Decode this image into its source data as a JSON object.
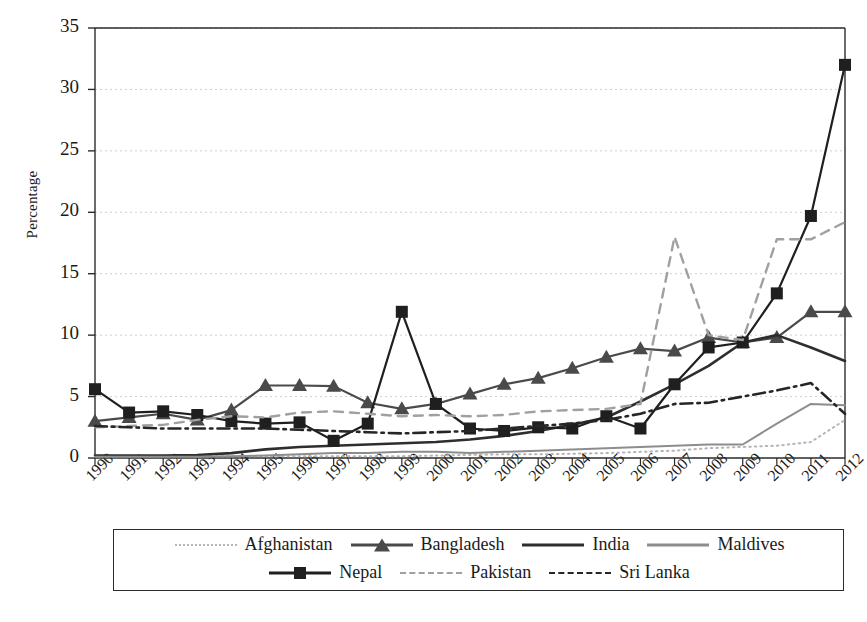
{
  "chart_data": {
    "type": "line",
    "title": "",
    "xlabel": "",
    "ylabel": "Percentage",
    "ylim": [
      0,
      35
    ],
    "yticks": [
      0,
      5,
      10,
      15,
      20,
      25,
      30,
      35
    ],
    "grid": true,
    "grid_axis": "y",
    "legend_position": "bottom",
    "x": [
      1990,
      1991,
      1992,
      1993,
      1994,
      1995,
      1996,
      1997,
      1998,
      1999,
      2000,
      2001,
      2002,
      2003,
      2004,
      2005,
      2006,
      2007,
      2008,
      2009,
      2010,
      2011,
      2012
    ],
    "categories": [
      "1990",
      "1991",
      "1992",
      "1993",
      "1994",
      "1995",
      "1996",
      "1997",
      "1998",
      "1999",
      "2000",
      "2001",
      "2002",
      "2003",
      "2004",
      "2005",
      "2006",
      "2007",
      "2008",
      "2009",
      "2010",
      "2011",
      "2012"
    ],
    "series": [
      {
        "name": "Afghanistan",
        "style": "dotted",
        "color": "#b5b5b5",
        "marker": "none",
        "values": [
          0.15,
          0.15,
          0.15,
          0.15,
          0.15,
          0.15,
          0.15,
          0.15,
          0.15,
          0.15,
          0.2,
          0.25,
          0.3,
          0.3,
          0.35,
          0.4,
          0.5,
          0.6,
          0.8,
          0.9,
          1.0,
          1.3,
          3.1
        ]
      },
      {
        "name": "Bangladesh",
        "style": "solid",
        "color": "#4a4a4a",
        "marker": "triangle",
        "values": [
          3.0,
          3.3,
          3.6,
          3.1,
          3.9,
          5.9,
          5.9,
          5.85,
          4.5,
          4.0,
          4.4,
          5.2,
          6.0,
          6.5,
          7.3,
          8.2,
          8.9,
          8.7,
          9.8,
          9.4,
          9.8,
          11.9,
          11.9
        ]
      },
      {
        "name": "India",
        "style": "solid",
        "color": "#2e2e2e",
        "marker": "none",
        "values": [
          0.2,
          0.2,
          0.2,
          0.25,
          0.4,
          0.7,
          0.9,
          1.0,
          1.1,
          1.2,
          1.3,
          1.5,
          1.8,
          2.2,
          2.7,
          3.3,
          4.6,
          6.0,
          7.5,
          9.4,
          10.0,
          9.0,
          7.9
        ]
      },
      {
        "name": "Maldives",
        "style": "solid",
        "color": "#8d8d8d",
        "marker": "none",
        "values": [
          0.1,
          0.1,
          0.1,
          0.1,
          0.15,
          0.2,
          0.3,
          0.4,
          0.4,
          0.5,
          0.5,
          0.4,
          0.5,
          0.6,
          0.7,
          0.8,
          0.9,
          1.0,
          1.1,
          1.1,
          2.8,
          4.4,
          4.3
        ]
      },
      {
        "name": "Nepal",
        "style": "solid",
        "color": "#1f1f1f",
        "marker": "square",
        "values": [
          5.6,
          3.7,
          3.8,
          3.5,
          3.0,
          2.8,
          2.9,
          1.4,
          2.8,
          11.9,
          4.4,
          2.4,
          2.2,
          2.5,
          2.4,
          3.4,
          2.4,
          6.0,
          9.0,
          9.4,
          13.4,
          19.7,
          32.0
        ]
      },
      {
        "name": "Pakistan",
        "style": "dashed",
        "color": "#a0a0a0",
        "marker": "none",
        "values": [
          2.5,
          2.6,
          2.7,
          3.1,
          3.4,
          3.3,
          3.7,
          3.8,
          3.6,
          3.4,
          3.5,
          3.4,
          3.5,
          3.8,
          3.9,
          4.0,
          4.4,
          18.0,
          10.0,
          9.6,
          17.8,
          17.8,
          19.2
        ]
      },
      {
        "name": "Sri Lanka",
        "style": "dashdot",
        "color": "#262626",
        "marker": "none",
        "values": [
          2.6,
          2.5,
          2.4,
          2.4,
          2.4,
          2.4,
          2.3,
          2.2,
          2.1,
          2.0,
          2.1,
          2.2,
          2.4,
          2.6,
          2.8,
          3.1,
          3.6,
          4.4,
          4.5,
          5.0,
          5.5,
          6.1,
          3.6
        ]
      }
    ]
  },
  "legend": {
    "rows": [
      [
        {
          "label": "Afghanistan",
          "style": "dotted",
          "marker": "none",
          "color": "#b5b5b5"
        },
        {
          "label": "Bangladesh",
          "style": "solid",
          "marker": "triangle",
          "color": "#4a4a4a"
        },
        {
          "label": "India",
          "style": "solid",
          "marker": "none",
          "color": "#2e2e2e"
        },
        {
          "label": "Maldives",
          "style": "solid",
          "marker": "none",
          "color": "#8d8d8d"
        }
      ],
      [
        {
          "label": "Nepal",
          "style": "solid",
          "marker": "square",
          "color": "#1f1f1f"
        },
        {
          "label": "Pakistan",
          "style": "dashed",
          "marker": "none",
          "color": "#a0a0a0"
        },
        {
          "label": "Sri Lanka",
          "style": "dashdot",
          "marker": "none",
          "color": "#262626"
        }
      ]
    ]
  },
  "axis": {
    "y_title": "Percentage",
    "grid_color": "#cfcfcf",
    "axis_color": "#2b2b2b"
  }
}
